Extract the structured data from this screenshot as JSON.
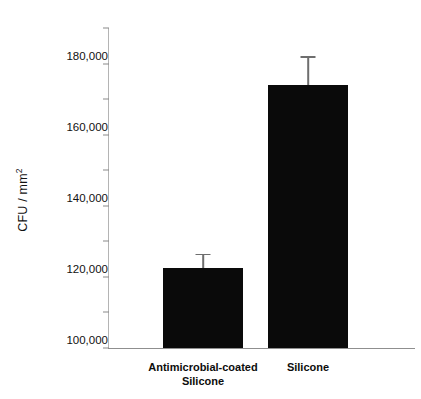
{
  "chart_data": {
    "type": "bar",
    "title": "",
    "subtitle": "",
    "xlabel": "",
    "ylabel": "CFU / mm",
    "ylabel_superscript": "2",
    "categories": [
      "Antimicrobial-coated\nSilicone",
      "Silicone"
    ],
    "values": [
      45000,
      148000
    ],
    "errors": [
      8000,
      16000
    ],
    "error_upper": [
      53000,
      164000
    ],
    "ylim": [
      0,
      180000
    ],
    "yticks": [
      0,
      20000,
      40000,
      60000,
      80000,
      100000,
      120000,
      140000,
      160000,
      180000
    ],
    "ytick_labels": [
      "0",
      "20,000",
      "40,000",
      "60,000",
      "80,000",
      "100,000",
      "120,000",
      "140,000",
      "160,000",
      "180,000"
    ],
    "grid": false,
    "legend": "none",
    "bar_color": "#0a0a0a",
    "error_color": "#6e6e6e",
    "axis_color": "#8f8f8f",
    "background": "#ffffff",
    "series": [
      {
        "name": "CFU / mm2",
        "values": [
          45000,
          148000
        ],
        "errors": [
          8000,
          16000
        ]
      }
    ]
  }
}
